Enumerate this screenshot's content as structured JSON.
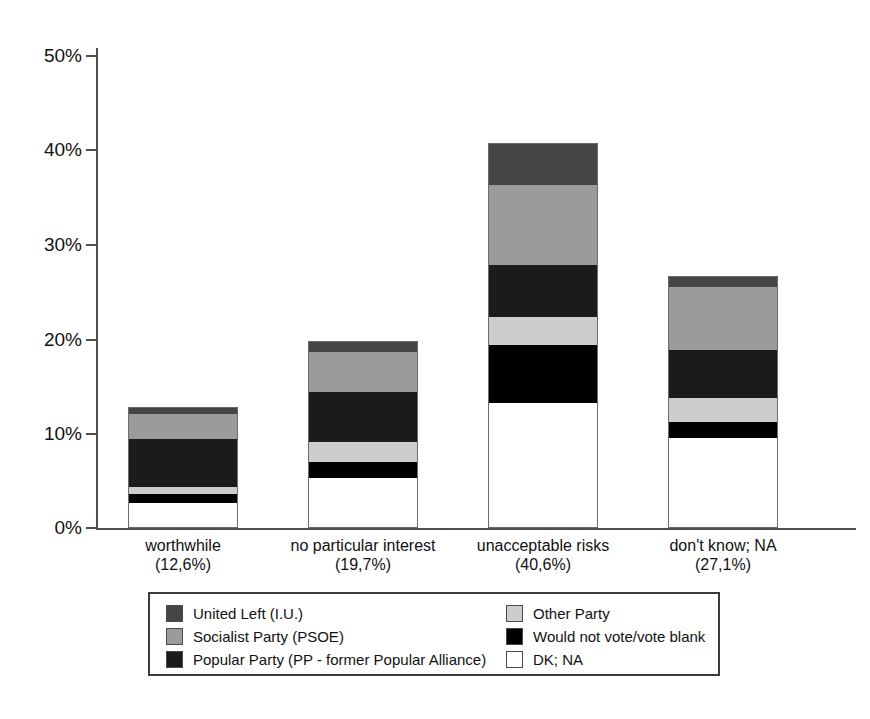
{
  "chart_data": {
    "type": "bar",
    "subtype": "stacked-bar",
    "title": "",
    "xlabel": "",
    "ylabel": "",
    "ylim": [
      0,
      50
    ],
    "grid": false,
    "legend_position": "bottom",
    "categories": [
      "worthwhile",
      "no particular interest",
      "unacceptable risks",
      "don't know; NA"
    ],
    "category_totals_label": [
      "(12,6%)",
      "(19,7%)",
      "(40,6%)",
      "(27,1%)"
    ],
    "category_totals": [
      12.6,
      19.7,
      40.6,
      27.1
    ],
    "series": [
      {
        "name": "United Left (I.U.)",
        "color": "#454545",
        "values": [
          0.7,
          1.1,
          4.5,
          1.2
        ]
      },
      {
        "name": "Socialist Party (PSOE)",
        "color": "#9b9b9b",
        "values": [
          2.7,
          4.2,
          8.5,
          6.7
        ]
      },
      {
        "name": "Popular Party (PP - former Popular Alliance)",
        "color": "#1b1b1b",
        "values": [
          5.1,
          5.3,
          5.5,
          5.1
        ]
      },
      {
        "name": "Other Party",
        "color": "#cdcdcd",
        "values": [
          0.8,
          2.1,
          3.0,
          2.6
        ]
      },
      {
        "name": "Would not vote/vote blank",
        "color": "#000000",
        "values": [
          0.9,
          1.7,
          6.2,
          1.7
        ]
      },
      {
        "name": "DK; NA",
        "color": "#ffffff",
        "values": [
          2.7,
          5.3,
          13.3,
          9.6
        ]
      }
    ],
    "stack_order_bottom_to_top": [
      "DK; NA",
      "Would not vote/vote blank",
      "Other Party",
      "Popular Party (PP - former Popular Alliance)",
      "Socialist Party (PSOE)",
      "United Left (I.U.)"
    ],
    "yticks": [
      {
        "value": 0,
        "label": "0%"
      },
      {
        "value": 10,
        "label": "10%"
      },
      {
        "value": 20,
        "label": "20%"
      },
      {
        "value": 30,
        "label": "30%"
      },
      {
        "value": 40,
        "label": "40%"
      },
      {
        "value": 50,
        "label": "50%"
      }
    ]
  },
  "axis": {
    "yticks": [
      {
        "label": "50%",
        "top": 46
      },
      {
        "label": "40%",
        "top": 140
      },
      {
        "label": "30%",
        "top": 235
      },
      {
        "label": "20%",
        "top": 330
      },
      {
        "label": "10%",
        "top": 424
      },
      {
        "label": "0%",
        "top": 518
      }
    ]
  },
  "bars": [
    {
      "name": "worthwhile",
      "left": 128,
      "segments": [
        {
          "key": "united-left",
          "h": 7
        },
        {
          "key": "socialist",
          "h": 25
        },
        {
          "key": "popular",
          "h": 48
        },
        {
          "key": "other",
          "h": 7
        },
        {
          "key": "wouldnotvote",
          "h": 9
        },
        {
          "key": "dkna",
          "h": 25
        }
      ]
    },
    {
      "name": "no particular interest",
      "left": 308,
      "segments": [
        {
          "key": "united-left",
          "h": 11
        },
        {
          "key": "socialist",
          "h": 40
        },
        {
          "key": "popular",
          "h": 50
        },
        {
          "key": "other",
          "h": 20
        },
        {
          "key": "wouldnotvote",
          "h": 16
        },
        {
          "key": "dkna",
          "h": 50
        }
      ]
    },
    {
      "name": "unacceptable risks",
      "left": 488,
      "segments": [
        {
          "key": "united-left",
          "h": 42
        },
        {
          "key": "socialist",
          "h": 80
        },
        {
          "key": "popular",
          "h": 52
        },
        {
          "key": "other",
          "h": 28
        },
        {
          "key": "wouldnotvote",
          "h": 58
        },
        {
          "key": "dkna",
          "h": 125
        }
      ]
    },
    {
      "name": "don't know; NA",
      "left": 668,
      "segments": [
        {
          "key": "united-left",
          "h": 11
        },
        {
          "key": "socialist",
          "h": 63
        },
        {
          "key": "popular",
          "h": 48
        },
        {
          "key": "other",
          "h": 24
        },
        {
          "key": "wouldnotvote",
          "h": 16
        },
        {
          "key": "dkna",
          "h": 90
        }
      ]
    }
  ],
  "x_labels": [
    {
      "name": "worthwhile",
      "pct": "(12,6%)",
      "left": 68
    },
    {
      "name": "no particular interest",
      "pct": "(19,7%)",
      "left": 248
    },
    {
      "name": "unacceptable risks",
      "pct": "(40,6%)",
      "left": 428
    },
    {
      "name": "don't know; NA",
      "pct": "(27,1%)",
      "left": 608
    }
  ],
  "legend": {
    "left_column": [
      {
        "label": "United Left (I.U.)",
        "swatch": "united-left"
      },
      {
        "label": "Socialist Party (PSOE)",
        "swatch": "socialist"
      },
      {
        "label": "Popular Party (PP - former Popular Alliance)",
        "swatch": "popular"
      }
    ],
    "right_column": [
      {
        "label": "Other Party",
        "swatch": "other"
      },
      {
        "label": "Would not vote/vote blank",
        "swatch": "wouldnot"
      },
      {
        "label": "DK; NA",
        "swatch": "dkna"
      }
    ]
  }
}
